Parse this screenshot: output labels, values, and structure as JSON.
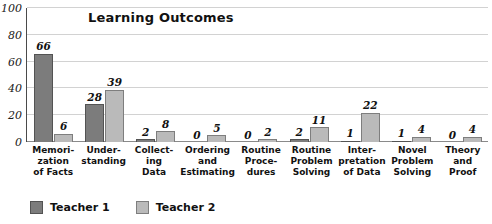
{
  "chart_data": {
    "type": "bar",
    "title": "Learning Outcomes",
    "xlabel": "",
    "ylabel": "",
    "ylim": [
      0,
      100
    ],
    "yticks": [
      0,
      20,
      40,
      60,
      80,
      100
    ],
    "grid": true,
    "legend_position": "bottom-left",
    "categories": [
      "Memori-\nzation\nof Facts",
      "Under-\nstanding",
      "Collect-\ning\nData",
      "Ordering\nand\nEstimating",
      "Routine\nProce-\ndures",
      "Routine\nProblem\nSolving",
      "Inter-\npretation\nof Data",
      "Novel\nProblem\nSolving",
      "Theory\nand\nProof"
    ],
    "series": [
      {
        "name": "Teacher 1",
        "color": "#7c7c7c",
        "values": [
          66,
          28,
          2,
          0,
          0,
          2,
          1,
          1,
          0
        ]
      },
      {
        "name": "Teacher 2",
        "color": "#bababa",
        "values": [
          6,
          39,
          8,
          5,
          2,
          11,
          22,
          4,
          4
        ]
      }
    ]
  },
  "legend": {
    "items": [
      {
        "label": "Teacher 1"
      },
      {
        "label": "Teacher 2"
      }
    ]
  }
}
